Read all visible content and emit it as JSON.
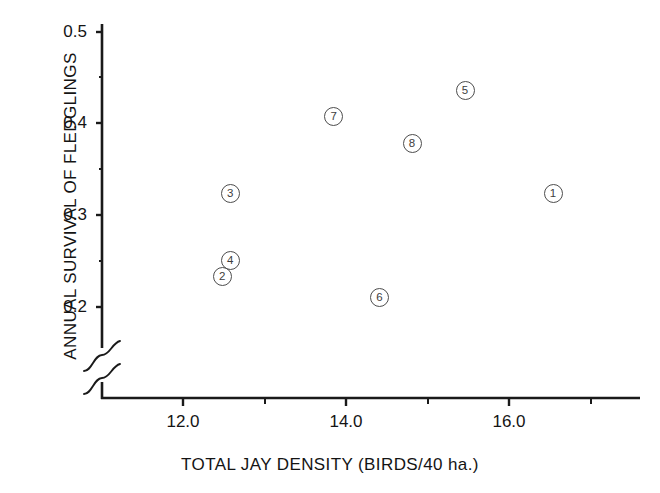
{
  "chart_data": {
    "type": "scatter",
    "title": "",
    "xlabel": "TOTAL JAY DENSITY (BIRDS/40 ha.)",
    "ylabel": "ANNUAL SURVIVAL OF FLEDGLINGS",
    "xlim": [
      11.12,
      17.58
    ],
    "ylim": [
      0.155,
      0.515
    ],
    "y_axis_break": true,
    "y_axis_break_note": "axis broken below 0.2 (zigzag symbol)",
    "grid": false,
    "legend": null,
    "xticks": [
      12.0,
      14.0,
      16.0
    ],
    "xtick_labels": [
      "12.0",
      "14.0",
      "16.0"
    ],
    "x_minor_ticks": [
      13.0,
      15.0,
      17.0
    ],
    "yticks": [
      0.2,
      0.3,
      0.4,
      0.5
    ],
    "ytick_labels": [
      "0.2",
      "0.3",
      "0.4",
      "0.5"
    ],
    "y_minor_ticks": [
      0.25,
      0.35,
      0.45
    ],
    "point_labels": [
      "1",
      "2",
      "3",
      "4",
      "5",
      "6",
      "7",
      "8"
    ],
    "points": [
      {
        "label": "1",
        "x": 16.54,
        "y": 0.324
      },
      {
        "label": "2",
        "x": 12.48,
        "y": 0.233
      },
      {
        "label": "3",
        "x": 12.58,
        "y": 0.324
      },
      {
        "label": "4",
        "x": 12.58,
        "y": 0.251
      },
      {
        "label": "5",
        "x": 15.46,
        "y": 0.436
      },
      {
        "label": "6",
        "x": 14.41,
        "y": 0.21
      },
      {
        "label": "7",
        "x": 13.85,
        "y": 0.408
      },
      {
        "label": "8",
        "x": 14.81,
        "y": 0.378
      }
    ]
  },
  "axes": {
    "x_title": "TOTAL JAY DENSITY (BIRDS/40 ha.)",
    "y_title": "ANNUAL SURVIVAL OF FLEDGLINGS",
    "x_tick_labels": [
      "12.0",
      "14.0",
      "16.0"
    ],
    "y_tick_labels": [
      "0.5",
      "0.4",
      "0.3",
      "0.2"
    ]
  },
  "colors": {
    "ink": "#141414",
    "marker_stroke": "#4d4d4d",
    "background": "#ffffff"
  }
}
